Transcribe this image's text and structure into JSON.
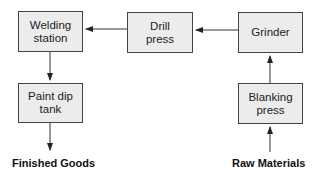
{
  "diagram": {
    "type": "process flow",
    "nodes": [
      {
        "id": "welding",
        "label_line1": "Welding",
        "label_line2": "station"
      },
      {
        "id": "drill",
        "label_line1": "Drill",
        "label_line2": "press"
      },
      {
        "id": "grinder",
        "label_line1": "Grinder",
        "label_line2": ""
      },
      {
        "id": "blanking",
        "label_line1": "Blanking",
        "label_line2": "press"
      },
      {
        "id": "paint",
        "label_line1": "Paint dip",
        "label_line2": "tank"
      }
    ],
    "terminals": {
      "input": "Raw Materials",
      "output": "Finished Goods"
    },
    "edges": [
      {
        "from": "Raw Materials",
        "to": "blanking"
      },
      {
        "from": "blanking",
        "to": "grinder"
      },
      {
        "from": "grinder",
        "to": "drill"
      },
      {
        "from": "drill",
        "to": "welding"
      },
      {
        "from": "welding",
        "to": "paint"
      },
      {
        "from": "paint",
        "to": "Finished Goods"
      }
    ],
    "colors": {
      "box_fill": "#ececec",
      "box_border": "#444444",
      "arrow": "#222222"
    }
  }
}
